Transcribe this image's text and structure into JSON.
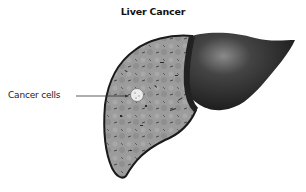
{
  "title": "Liver Cancer",
  "annotations": [
    {
      "label": "Cancer cells",
      "target": "tumor"
    }
  ],
  "colors": {
    "liver_cut_surface": "#9a9a9a",
    "liver_outline": "#1a1a1a",
    "right_lobe": "#2e2e2e",
    "tumor": "#e8e8e8"
  }
}
